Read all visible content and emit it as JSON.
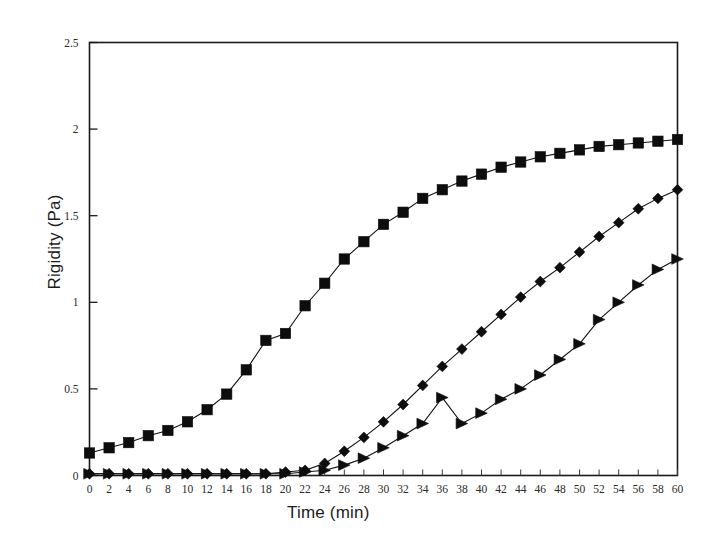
{
  "chart_data": {
    "type": "line",
    "title": "",
    "xlabel": "Time (min)",
    "ylabel": "Rigidity (Pa)",
    "xlim": [
      0,
      60
    ],
    "ylim": [
      0,
      2.5
    ],
    "xticks": [
      0,
      2,
      4,
      6,
      8,
      10,
      12,
      14,
      16,
      18,
      20,
      22,
      24,
      26,
      28,
      30,
      32,
      34,
      36,
      38,
      40,
      42,
      44,
      46,
      48,
      50,
      52,
      54,
      56,
      58,
      60
    ],
    "yticks": [
      0,
      0.5,
      1,
      1.5,
      2,
      2.5
    ],
    "ytick_labels": [
      "0",
      "0.5",
      "1",
      "1.5",
      "2",
      "2.5"
    ],
    "grid": false,
    "legend": "none",
    "x": [
      0,
      2,
      4,
      6,
      8,
      10,
      12,
      14,
      16,
      18,
      20,
      22,
      24,
      26,
      28,
      30,
      32,
      34,
      36,
      38,
      40,
      42,
      44,
      46,
      48,
      50,
      52,
      54,
      56,
      58,
      60
    ],
    "series": [
      {
        "name": "series-squares",
        "marker": "square",
        "color": "#0d0d0d",
        "values": [
          0.13,
          0.16,
          0.19,
          0.23,
          0.26,
          0.31,
          0.38,
          0.47,
          0.61,
          0.78,
          0.82,
          0.98,
          1.11,
          1.25,
          1.35,
          1.45,
          1.52,
          1.6,
          1.65,
          1.7,
          1.74,
          1.78,
          1.81,
          1.84,
          1.86,
          1.88,
          1.9,
          1.91,
          1.92,
          1.93,
          1.94
        ]
      },
      {
        "name": "series-diamonds",
        "marker": "diamond",
        "color": "#0d0d0d",
        "values": [
          0.01,
          0.01,
          0.01,
          0.01,
          0.01,
          0.01,
          0.01,
          0.01,
          0.01,
          0.01,
          0.02,
          0.03,
          0.07,
          0.14,
          0.22,
          0.31,
          0.41,
          0.52,
          0.63,
          0.73,
          0.83,
          0.93,
          1.03,
          1.12,
          1.2,
          1.29,
          1.38,
          1.46,
          1.54,
          1.6,
          1.65
        ]
      },
      {
        "name": "series-triangles",
        "marker": "triangle-right",
        "color": "#0d0d0d",
        "values": [
          0.01,
          0.01,
          0.01,
          0.01,
          0.01,
          0.01,
          0.01,
          0.01,
          0.01,
          0.01,
          0.01,
          0.02,
          0.03,
          0.06,
          0.1,
          0.16,
          0.23,
          0.3,
          0.45,
          0.3,
          0.36,
          0.44,
          0.5,
          0.58,
          0.67,
          0.76,
          0.9,
          1.0,
          1.1,
          1.19,
          1.25
        ]
      }
    ]
  }
}
